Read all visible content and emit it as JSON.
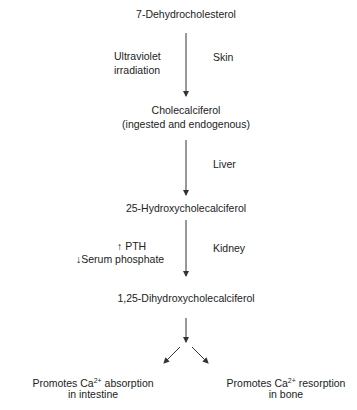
{
  "diagram": {
    "nodes": {
      "n1": "7-Dehydrocholesterol",
      "n2_line1": "Cholecalciferol",
      "n2_line2": "(ingested and endogenous)",
      "n3": "25-Hydroxycholecalciferol",
      "n4": "1,25-Dihydroxycholecalciferol",
      "out_left_pre": "Promotes Ca",
      "out_left_sup": "2+",
      "out_left_post": " absorption",
      "out_left_line2": "in intestine",
      "out_right_pre": "Promotes Ca",
      "out_right_sup": "2+",
      "out_right_post": " resorption",
      "out_right_line2": "in bone"
    },
    "step1": {
      "left_line1": "Ultraviolet",
      "left_line2": "irradiation",
      "site": "Skin"
    },
    "step2": {
      "site": "Liver"
    },
    "step3": {
      "left_line1": "↑ PTH",
      "left_line2": "↓Serum phosphate",
      "site": "Kidney"
    }
  }
}
